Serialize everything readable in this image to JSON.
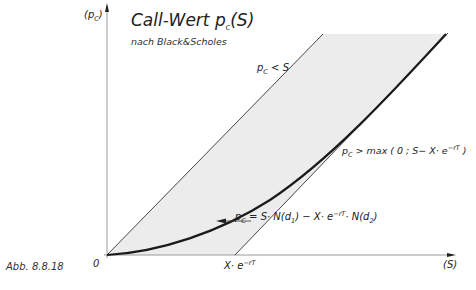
{
  "figure": {
    "title": "Call-Wert p",
    "title_sub": "C",
    "title_arg": "(S)",
    "subtitle": "nach Black&Scholes",
    "caption": "Abb. 8.8.18"
  },
  "axes": {
    "y_label": "(p",
    "y_label_sub": "C",
    "y_label_end": ")",
    "x_label": "(S)",
    "origin_label": "0",
    "x_marker_label": "X· e",
    "x_marker_sup": "−rT"
  },
  "annotations": {
    "upper_bound": {
      "p": "p",
      "sub": "C",
      "rest": " < S"
    },
    "lower_bound": {
      "p": "p",
      "sub": "C",
      "rest": " > max ( 0 ; S− X· e",
      "sup": "−rT",
      "end": " )"
    },
    "formula": {
      "p": "p",
      "sub": "C",
      "a": " = S· N(d",
      "a_sub": "1",
      "b": ") − X· e",
      "b_sup": "−rT",
      "c": "· N(d",
      "c_sub": "2",
      "d": ")"
    }
  },
  "colors": {
    "shade": "#ececec",
    "line": "#333333",
    "curve": "#1a1a1a",
    "axis": "#888888"
  }
}
